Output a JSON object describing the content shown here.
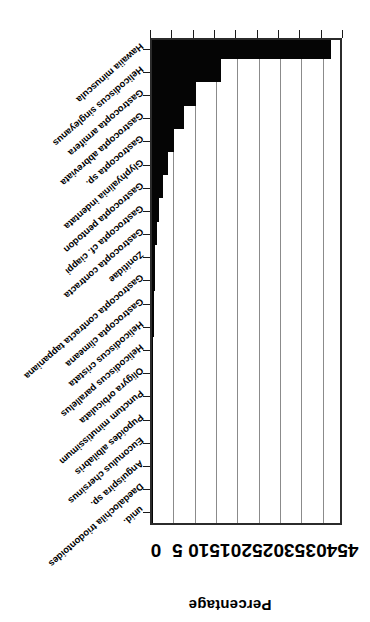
{
  "figure": {
    "rotation_note": "printed-upside-down",
    "orientation": "horizontal-bars",
    "axis_title": "Percentage"
  },
  "chart_data": {
    "type": "bar",
    "title": "",
    "subtitle": "",
    "xlabel": "",
    "ylabel": "Percentage",
    "orientation": "horizontal",
    "grid": true,
    "legend": false,
    "legend_position": "none",
    "xlim": [
      0,
      45
    ],
    "tick_labels": [
      "0",
      "5",
      "10",
      "15",
      "20",
      "25",
      "30",
      "35",
      "40",
      "45"
    ],
    "tick_values": [
      0,
      5,
      10,
      15,
      20,
      25,
      30,
      35,
      40,
      45
    ],
    "categories": [
      "Hawaiia minuscula",
      "Helicodiscus singleyanus",
      "Gastrocopta armifera",
      "Gastrocopta abbreviata",
      "Gastrocopta sp.",
      "Glyphyalinia indentata",
      "Gastrocopta pentodon",
      "Gastrocopta cf. ciappi",
      "Gastrocopta contracta",
      "Zonitidae",
      "Gastrocopta contracta tappaniana",
      "Gastrocopta climeana",
      "Helicodiscus cristata",
      "Helicodiscus parallelus",
      "Oligyra orbiculata",
      "Punctum minutissimum",
      "Pupoides albilabris",
      "Euconulus chersinus",
      "Anguispira sp.",
      "Daedalochila triodontoides",
      "unid."
    ],
    "values": [
      42.0,
      16.2,
      10.4,
      7.4,
      5.2,
      3.8,
      2.6,
      1.6,
      1.1,
      0.8,
      0.6,
      0.5,
      0.4,
      0.35,
      0.3,
      0.3,
      0.25,
      0.2,
      0.2,
      0.15,
      0.15
    ]
  }
}
